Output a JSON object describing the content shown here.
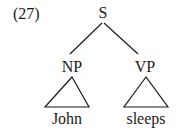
{
  "example": {
    "number": "(27)"
  },
  "tree": {
    "root": {
      "label": "S"
    },
    "children": [
      {
        "label": "NP",
        "terminal": "John",
        "triangle": true
      },
      {
        "label": "VP",
        "terminal": "sleeps",
        "triangle": true
      }
    ]
  },
  "style": {
    "line_color": "#1a1a1a",
    "background": "#ffffff"
  }
}
